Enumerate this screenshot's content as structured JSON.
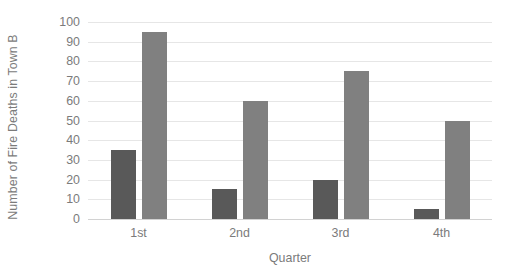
{
  "chart_data": {
    "type": "bar",
    "title": "",
    "subtitle": "",
    "xlabel": "Quarter",
    "ylabel": "Number of Fire Deaths in Town B",
    "categories": [
      "1st",
      "2nd",
      "3rd",
      "4th"
    ],
    "series": [
      {
        "name": "Series 1",
        "color": "#595959",
        "values": [
          35,
          15,
          20,
          5
        ]
      },
      {
        "name": "Series 2",
        "color": "#808080",
        "values": [
          95,
          60,
          75,
          50
        ]
      }
    ],
    "ylim": [
      0,
      100
    ],
    "ytick_step": 10,
    "yticks": [
      0,
      10,
      20,
      30,
      40,
      50,
      60,
      70,
      80,
      90,
      100
    ],
    "ytick_labels": [
      "0",
      "10",
      "20",
      "30",
      "40",
      "50",
      "60",
      "70",
      "80",
      "90",
      "100"
    ],
    "grid": {
      "horizontal": true,
      "vertical": false,
      "color": "#e6e6e6"
    },
    "legend": {
      "visible": false,
      "position": "none"
    },
    "axis_color": "#d2d2d2",
    "text_color": "#7b7b7b",
    "background": "#ffffff"
  }
}
